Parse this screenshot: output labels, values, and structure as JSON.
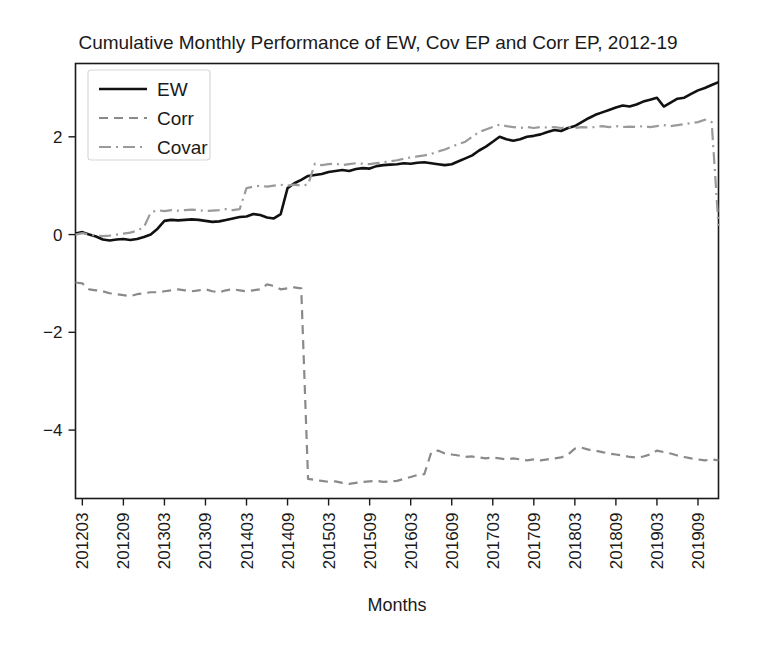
{
  "chart_data": {
    "type": "line",
    "title": "Cumulative Monthly Performance of EW, Cov EP and Corr EP, 2012-19",
    "xlabel": "Months",
    "ylabel": "",
    "grid": false,
    "legend_position": "top-left",
    "ylim": [
      -5.4,
      3.5
    ],
    "yticks": [
      2,
      0,
      -2,
      -4
    ],
    "ytick_labels": [
      "2",
      "0",
      "−2",
      "−4"
    ],
    "xtick_labels": [
      "201203",
      "201209",
      "201303",
      "201309",
      "201403",
      "201409",
      "201503",
      "201509",
      "201603",
      "201609",
      "201703",
      "201709",
      "201803",
      "201809",
      "201903",
      "201909"
    ],
    "xtick_rotation": 90,
    "x_index_min": 0,
    "x_index_max": 94,
    "xtick_indices": [
      1,
      7,
      13,
      19,
      25,
      31,
      37,
      43,
      49,
      55,
      61,
      67,
      73,
      79,
      85,
      91
    ],
    "series": [
      {
        "name": "EW",
        "color": "#111111",
        "style": "solid",
        "width": 2.6,
        "values": [
          0.02,
          0.05,
          0.0,
          -0.04,
          -0.1,
          -0.12,
          -0.1,
          -0.09,
          -0.11,
          -0.09,
          -0.05,
          0.0,
          0.12,
          0.28,
          0.3,
          0.29,
          0.3,
          0.31,
          0.3,
          0.28,
          0.26,
          0.27,
          0.3,
          0.33,
          0.36,
          0.37,
          0.42,
          0.4,
          0.35,
          0.33,
          0.42,
          0.95,
          1.05,
          1.12,
          1.2,
          1.22,
          1.24,
          1.28,
          1.3,
          1.32,
          1.3,
          1.34,
          1.36,
          1.35,
          1.4,
          1.42,
          1.43,
          1.44,
          1.46,
          1.45,
          1.47,
          1.48,
          1.46,
          1.44,
          1.42,
          1.44,
          1.5,
          1.56,
          1.62,
          1.72,
          1.8,
          1.9,
          2.0,
          1.95,
          1.92,
          1.95,
          2.0,
          2.02,
          2.05,
          2.1,
          2.14,
          2.12,
          2.18,
          2.22,
          2.3,
          2.38,
          2.45,
          2.5,
          2.55,
          2.6,
          2.64,
          2.62,
          2.66,
          2.72,
          2.76,
          2.8,
          2.62,
          2.7,
          2.78,
          2.8,
          2.88,
          2.95,
          3.0,
          3.06,
          3.12
        ]
      },
      {
        "name": "Corr",
        "color": "#8a8a8a",
        "style": "dashed",
        "width": 2.2,
        "values": [
          -0.98,
          -1.0,
          -1.12,
          -1.14,
          -1.16,
          -1.2,
          -1.22,
          -1.24,
          -1.26,
          -1.22,
          -1.2,
          -1.18,
          -1.18,
          -1.16,
          -1.14,
          -1.12,
          -1.14,
          -1.16,
          -1.14,
          -1.12,
          -1.16,
          -1.18,
          -1.14,
          -1.12,
          -1.14,
          -1.16,
          -1.14,
          -1.12,
          -1.02,
          -1.05,
          -1.12,
          -1.1,
          -1.08,
          -1.1,
          -5.0,
          -5.02,
          -5.04,
          -5.06,
          -5.05,
          -5.08,
          -5.1,
          -5.08,
          -5.06,
          -5.05,
          -5.04,
          -5.06,
          -5.05,
          -5.04,
          -5.0,
          -4.96,
          -4.92,
          -4.9,
          -4.46,
          -4.42,
          -4.48,
          -4.5,
          -4.52,
          -4.55,
          -4.54,
          -4.56,
          -4.58,
          -4.56,
          -4.58,
          -4.6,
          -4.58,
          -4.6,
          -4.62,
          -4.6,
          -4.62,
          -4.6,
          -4.58,
          -4.56,
          -4.5,
          -4.38,
          -4.36,
          -4.4,
          -4.42,
          -4.45,
          -4.48,
          -4.5,
          -4.52,
          -4.55,
          -4.56,
          -4.54,
          -4.5,
          -4.42,
          -4.45,
          -4.48,
          -4.52,
          -4.55,
          -4.58,
          -4.6,
          -4.62,
          -4.6,
          -4.62
        ]
      },
      {
        "name": "Covar",
        "color": "#9a9a9a",
        "style": "dashdot",
        "width": 2.2,
        "values": [
          0.0,
          0.03,
          0.0,
          -0.02,
          -0.03,
          -0.02,
          0.0,
          0.02,
          0.04,
          0.08,
          0.15,
          0.45,
          0.5,
          0.48,
          0.5,
          0.49,
          0.5,
          0.51,
          0.5,
          0.48,
          0.49,
          0.5,
          0.52,
          0.5,
          0.52,
          0.95,
          0.98,
          1.0,
          0.98,
          1.0,
          1.02,
          1.0,
          1.02,
          1.0,
          1.02,
          1.45,
          1.42,
          1.44,
          1.45,
          1.42,
          1.44,
          1.46,
          1.45,
          1.44,
          1.46,
          1.48,
          1.5,
          1.52,
          1.55,
          1.58,
          1.6,
          1.62,
          1.65,
          1.7,
          1.74,
          1.8,
          1.85,
          1.9,
          2.0,
          2.1,
          2.15,
          2.2,
          2.25,
          2.22,
          2.2,
          2.18,
          2.2,
          2.18,
          2.2,
          2.19,
          2.2,
          2.18,
          2.2,
          2.18,
          2.2,
          2.19,
          2.2,
          2.22,
          2.2,
          2.22,
          2.2,
          2.21,
          2.2,
          2.22,
          2.2,
          2.22,
          2.24,
          2.22,
          2.24,
          2.26,
          2.28,
          2.3,
          2.35,
          2.3,
          0.18
        ]
      }
    ]
  },
  "legend": {
    "items": [
      {
        "label": "EW"
      },
      {
        "label": "Corr"
      },
      {
        "label": "Covar"
      }
    ]
  }
}
